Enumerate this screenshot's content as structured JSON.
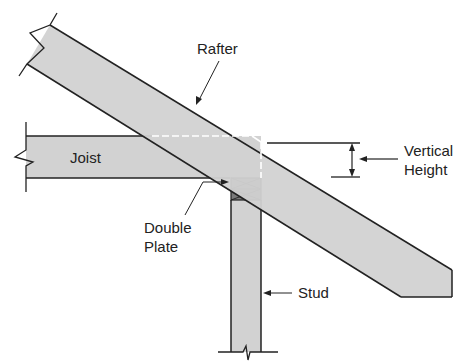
{
  "diagram": {
    "colors": {
      "wood": "#d2d2d2",
      "plate": "#7a7a7a",
      "outline": "#222222",
      "dash": "#ffffff",
      "background": "#ffffff"
    },
    "labels": {
      "rafter": "Rafter",
      "joist": "Joist",
      "vertical_height_line1": "Vertical",
      "vertical_height_line2": "Height",
      "double_plate_line1": "Double",
      "double_plate_line2": "Plate",
      "stud": "Stud"
    }
  }
}
